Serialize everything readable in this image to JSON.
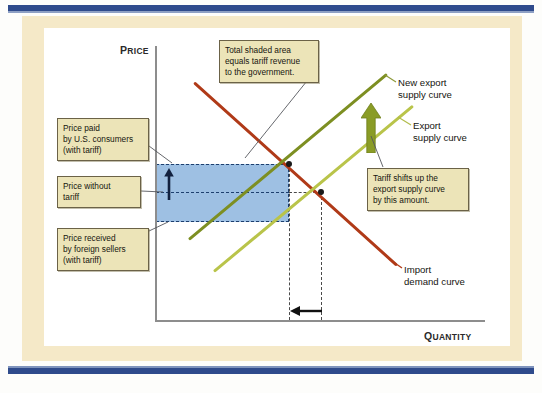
{
  "figure": {
    "type": "economics-diagram",
    "topic": "Effect of a tariff on export supply, import demand, price and quantity"
  },
  "axes": {
    "y": {
      "label_main": "P",
      "label_rest": "RICE",
      "full": "PRICE"
    },
    "x": {
      "label_main": "Q",
      "label_rest": "UANTITY",
      "full": "QUANTITY"
    }
  },
  "callouts": {
    "revenue": {
      "line1": "Total shaded area",
      "line2": "equals tariff revenue",
      "line3": "to the government."
    },
    "price_paid": {
      "line1": "Price paid",
      "line2": "by U.S. consumers",
      "line3": "(with tariff)"
    },
    "price_without": {
      "line1": "Price without",
      "line2": "tariff"
    },
    "price_received": {
      "line1": "Price received",
      "line2": "by foreign sellers",
      "line3": "(with tariff)"
    },
    "tariff_shift": {
      "line1": "Tariff shifts up the",
      "line2": "export supply curve",
      "line3": "by this amount."
    }
  },
  "curve_labels": {
    "new_export_supply": {
      "line1": "New export",
      "line2": "supply curve"
    },
    "export_supply": {
      "line1": "Export",
      "line2": "supply curve"
    },
    "import_demand": {
      "line1": "Import",
      "line2": "demand curve"
    }
  },
  "colors": {
    "import_demand_curve": "#b03a18",
    "new_export_supply_curve": "#7d8f22",
    "export_supply_curve": "#b9c44a",
    "shaded_tariff_revenue": "#9ec0e3",
    "shade_border": "#1d3f6e",
    "callout_fill": "#ece4b8",
    "callout_border": "#6b6247",
    "frame_cream": "#f5e9c8",
    "frame_navy": "#2f4b8c",
    "shift_arrow": "#8a9c26",
    "price_arrow": "#12213f",
    "quantity_arrow": "#111111"
  },
  "chart_data": {
    "type": "line",
    "title": "",
    "xlabel": "QUANTITY",
    "ylabel": "PRICE",
    "grid": false,
    "legend_position": "right-inline-labels",
    "xlim": [
      0,
      100
    ],
    "ylim": [
      0,
      100
    ],
    "series": [
      {
        "name": "Import demand curve",
        "color": "#b03a18",
        "points": [
          [
            11.5,
            86.5
          ],
          [
            73.0,
            19.7
          ]
        ],
        "note": "downward sloping"
      },
      {
        "name": "New export supply curve",
        "color": "#7d8f22",
        "points": [
          [
            10.0,
            29.2
          ],
          [
            70.0,
            89.5
          ]
        ],
        "note": "upward sloping, shifted up by tariff"
      },
      {
        "name": "Export supply curve",
        "color": "#b9c44a",
        "points": [
          [
            17.6,
            17.5
          ],
          [
            78.0,
            78.0
          ]
        ],
        "note": "upward sloping, original"
      }
    ],
    "annotations": [
      {
        "name": "equilibrium-with-tariff",
        "x": 40.6,
        "y": 57.0,
        "marker": "dot"
      },
      {
        "name": "equilibrium-without-tariff",
        "x": 50.3,
        "y": 46.5,
        "marker": "dot"
      },
      {
        "name": "price-paid-with-tariff",
        "y": 57.0,
        "kind": "h-dashed"
      },
      {
        "name": "price-without-tariff",
        "y": 46.5,
        "kind": "h-dashed"
      },
      {
        "name": "price-received-with-tariff",
        "y": 35.6,
        "kind": "h-dashed"
      },
      {
        "name": "quantity-with-tariff",
        "x": 40.6,
        "kind": "v-dashed"
      },
      {
        "name": "quantity-without-tariff",
        "x": 50.3,
        "kind": "v-dashed"
      },
      {
        "name": "tariff-revenue-rectangle",
        "x_range": [
          0,
          40.6
        ],
        "y_range": [
          35.6,
          57.0
        ],
        "fill": "#9ec0e3"
      },
      {
        "name": "price-increase-arrow",
        "direction": "up"
      },
      {
        "name": "supply-shift-arrow",
        "direction": "up"
      },
      {
        "name": "quantity-decrease-arrow",
        "direction": "left"
      }
    ]
  }
}
